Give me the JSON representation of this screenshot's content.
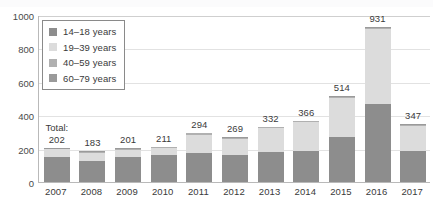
{
  "chart_data": {
    "type": "bar",
    "subtype": "stacked-bar",
    "title": "",
    "xlabel": "",
    "ylabel": "",
    "ylim": [
      0,
      1000
    ],
    "yticks": [
      0,
      200,
      400,
      600,
      800,
      1000
    ],
    "grid": true,
    "legend_position": "top-left-inside",
    "categories": [
      "2007",
      "2008",
      "2009",
      "2010",
      "2011",
      "2012",
      "2013",
      "2014",
      "2015",
      "2016",
      "2017"
    ],
    "totals": [
      202,
      183,
      201,
      211,
      294,
      269,
      332,
      366,
      514,
      931,
      347
    ],
    "total_prefix_label": "Total:",
    "series": [
      {
        "name": "14–18 years",
        "color": "#8d8d8d",
        "values": [
          152,
          128,
          148,
          160,
          172,
          160,
          180,
          186,
          268,
          470,
          186
        ]
      },
      {
        "name": "19–39 years",
        "color": "#dcdcdc",
        "values": [
          44,
          48,
          46,
          44,
          112,
          100,
          142,
          172,
          236,
          446,
          152
        ]
      },
      {
        "name": "40–59 years",
        "color": "#b0b0b0",
        "values": [
          4,
          5,
          5,
          5,
          7,
          6,
          7,
          6,
          7,
          9,
          6
        ]
      },
      {
        "name": "60–79 years",
        "color": "#9a9a9a",
        "values": [
          2,
          2,
          2,
          2,
          3,
          3,
          3,
          2,
          3,
          6,
          3
        ]
      }
    ]
  },
  "legend": {
    "items": [
      {
        "label": "14–18 years",
        "color": "#8d8d8d"
      },
      {
        "label": "19–39 years",
        "color": "#dcdcdc"
      },
      {
        "label": "40–59 years",
        "color": "#b0b0b0"
      },
      {
        "label": "60–79 years",
        "color": "#9a9a9a"
      }
    ]
  },
  "colors": {
    "axis": "#b9b9b9",
    "grid": "#e2e2e2",
    "text": "#3a3a3a",
    "background": "#ffffff"
  }
}
